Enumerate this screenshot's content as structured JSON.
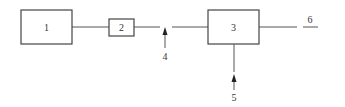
{
  "diagram": {
    "type": "block-flow-diagram",
    "colors": {
      "stroke": "#444444",
      "text": "#333333",
      "background": "#ffffff"
    },
    "nodes": [
      {
        "id": "1",
        "label": "1"
      },
      {
        "id": "2",
        "label": "2"
      },
      {
        "id": "3",
        "label": "3"
      }
    ],
    "labels": {
      "input_4": "4",
      "input_5": "5",
      "output_6": "6"
    },
    "edges": [
      {
        "from": "1",
        "to": "2"
      },
      {
        "from": "2",
        "to": "3"
      },
      {
        "from": "4",
        "to": "2-3 line",
        "arrow": "up"
      },
      {
        "from": "5",
        "to": "3",
        "arrow": "up"
      },
      {
        "from": "3",
        "to": "6"
      }
    ]
  }
}
